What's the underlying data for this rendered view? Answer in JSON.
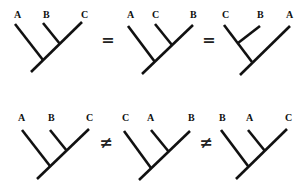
{
  "diagram": {
    "title": "",
    "rows": [
      {
        "id": "row-equal",
        "relations": [
          "=",
          "="
        ],
        "relation_positions": [
          [
            108,
            45
          ],
          [
            209,
            45
          ]
        ],
        "trees": [
          {
            "labels": [
              {
                "text": "A",
                "x": 14,
                "y": 18
              },
              {
                "text": "B",
                "x": 43,
                "y": 18
              },
              {
                "text": "C",
                "x": 81,
                "y": 18
              }
            ],
            "edges": [
              [
                15,
                24,
                43,
                60
              ],
              [
                43,
                23,
                60,
                44
              ],
              [
                82,
                22,
                31,
                72
              ]
            ],
            "grouping": "(A,(B,C))"
          },
          {
            "labels": [
              {
                "text": "A",
                "x": 127,
                "y": 18
              },
              {
                "text": "C",
                "x": 152,
                "y": 18
              },
              {
                "text": "B",
                "x": 190,
                "y": 18
              }
            ],
            "edges": [
              [
                128,
                26,
                155,
                62
              ],
              [
                155,
                24,
                172,
                45
              ],
              [
                193,
                25,
                142,
                74
              ]
            ],
            "grouping": "(A,(C,B))"
          },
          {
            "labels": [
              {
                "text": "C",
                "x": 222,
                "y": 18
              },
              {
                "text": "B",
                "x": 257,
                "y": 18
              },
              {
                "text": "A",
                "x": 286,
                "y": 18
              }
            ],
            "edges": [
              [
                224,
                25,
                252,
                62
              ],
              [
                260,
                26,
                238,
                43
              ],
              [
                290,
                26,
                240,
                75
              ]
            ],
            "grouping": "((C,B),A)"
          }
        ]
      },
      {
        "id": "row-notequal",
        "relations": [
          "≠",
          "≠"
        ],
        "relation_positions": [
          [
            106,
            148
          ],
          [
            206,
            148
          ]
        ],
        "trees": [
          {
            "labels": [
              {
                "text": "A",
                "x": 18,
                "y": 121
              },
              {
                "text": "B",
                "x": 48,
                "y": 121
              },
              {
                "text": "C",
                "x": 86,
                "y": 121
              }
            ],
            "edges": [
              [
                22,
                130,
                50,
                166
              ],
              [
                50,
                130,
                67,
                151
              ],
              [
                89,
                129,
                37,
                179
              ]
            ],
            "grouping": "(A,(B,C))"
          },
          {
            "labels": [
              {
                "text": "C",
                "x": 122,
                "y": 121
              },
              {
                "text": "A",
                "x": 147,
                "y": 121
              },
              {
                "text": "B",
                "x": 188,
                "y": 121
              }
            ],
            "edges": [
              [
                124,
                131,
                151,
                168
              ],
              [
                151,
                130,
                169,
                152
              ],
              [
                190,
                131,
                139,
                180
              ]
            ],
            "grouping": "(C,(A,B))"
          },
          {
            "labels": [
              {
                "text": "B",
                "x": 219,
                "y": 121
              },
              {
                "text": "A",
                "x": 246,
                "y": 121
              },
              {
                "text": "C",
                "x": 285,
                "y": 121
              }
            ],
            "edges": [
              [
                221,
                130,
                248,
                166
              ],
              [
                248,
                130,
                265,
                151
              ],
              [
                287,
                129,
                236,
                179
              ]
            ],
            "grouping": "(B,(A,C))"
          }
        ]
      }
    ],
    "colors": {
      "line": "#111111",
      "background": "#ffffff"
    }
  }
}
